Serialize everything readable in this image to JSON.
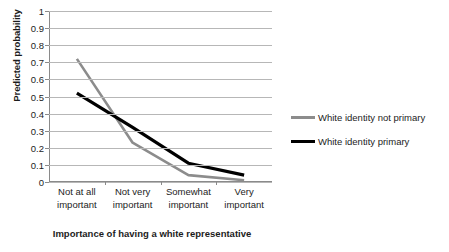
{
  "chart_data": {
    "type": "line",
    "title": "",
    "subtitle": "",
    "xlabel": "Importance of having a white representative",
    "ylabel": "Predicted probability",
    "categories": [
      "Not at all\nimportant",
      "Not very\nimportant",
      "Somewhat\nimportant",
      "Very\nimportant"
    ],
    "category_lines": [
      [
        "Not at all",
        "important"
      ],
      [
        "Not very",
        "important"
      ],
      [
        "Somewhat",
        "important"
      ],
      [
        "Very",
        "important"
      ]
    ],
    "series": [
      {
        "name": "White identity not primary",
        "color": "#8c8c8c",
        "width": 2.6,
        "values": [
          0.72,
          0.23,
          0.04,
          0.01
        ]
      },
      {
        "name": "White identity primary",
        "color": "#000000",
        "width": 3.2,
        "values": [
          0.52,
          0.32,
          0.11,
          0.04
        ]
      }
    ],
    "ylim": [
      0,
      1
    ],
    "ytick_step": 0.1,
    "ytick_labels": [
      "0",
      "0.1",
      "0.2",
      "0.3",
      "0.4",
      "0.5",
      "0.6",
      "0.7",
      "0.8",
      "0.9",
      "1"
    ],
    "grid": true,
    "grid_color": "#b7b7b7",
    "legend_position": "right",
    "axis_color": "#8a8a8a",
    "background": "#ffffff"
  },
  "legend": {
    "items": [
      {
        "label": "White identity not primary"
      },
      {
        "label": "White identity primary"
      }
    ]
  }
}
